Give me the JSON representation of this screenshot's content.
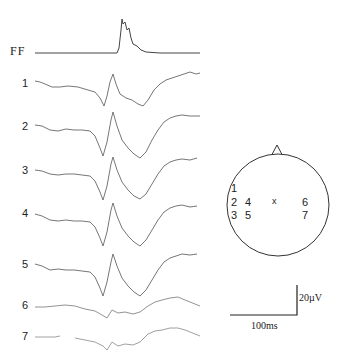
{
  "traces": [
    {
      "label": "FF",
      "y": 53
    },
    {
      "label": "1",
      "y": 85
    },
    {
      "label": "2",
      "y": 128
    },
    {
      "label": "3",
      "y": 172
    },
    {
      "label": "4",
      "y": 215
    },
    {
      "label": "5",
      "y": 266
    },
    {
      "label": "6",
      "y": 306
    },
    {
      "label": "7",
      "y": 338
    }
  ],
  "head_map": {
    "electrodes": [
      {
        "label": "1",
        "x": 231,
        "y": 182
      },
      {
        "label": "2",
        "x": 231,
        "y": 196
      },
      {
        "label": "4",
        "x": 246,
        "y": 196
      },
      {
        "label": "x",
        "x": 270,
        "y": 196
      },
      {
        "label": "6",
        "x": 301,
        "y": 196
      },
      {
        "label": "3",
        "x": 231,
        "y": 210
      },
      {
        "label": "5",
        "x": 246,
        "y": 210
      },
      {
        "label": "7",
        "x": 301,
        "y": 210
      }
    ]
  },
  "scale_bar": {
    "voltage_label": "20µV",
    "time_label": "100ms"
  },
  "colors": {
    "trace": "#555555",
    "ink": "#222222"
  }
}
